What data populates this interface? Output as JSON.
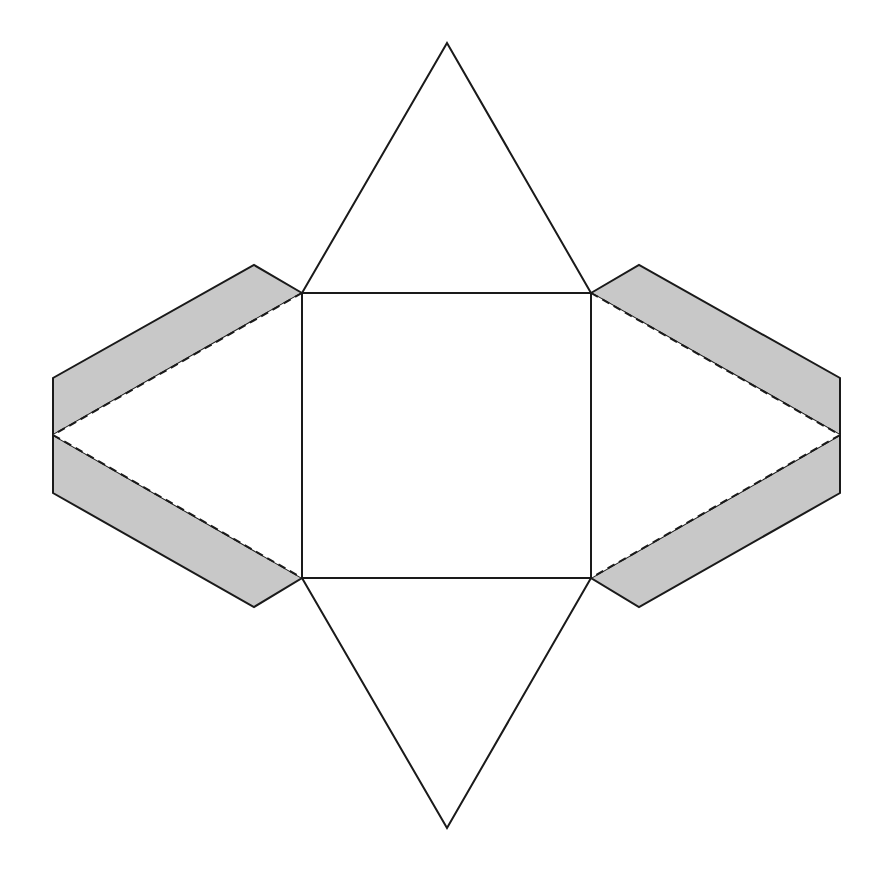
{
  "diagram": {
    "type": "net",
    "colors": {
      "background": "#ffffff",
      "stroke": "#1a1a1a",
      "tab_fill": "#c8c8c8"
    },
    "base_square": {
      "points": [
        [
          302,
          293
        ],
        [
          591,
          293
        ],
        [
          591,
          578
        ],
        [
          302,
          578
        ]
      ]
    },
    "triangles": [
      {
        "name": "top",
        "points": [
          [
            302,
            293
          ],
          [
            447,
            43
          ],
          [
            591,
            293
          ]
        ]
      },
      {
        "name": "bottom",
        "points": [
          [
            302,
            578
          ],
          [
            447,
            828
          ],
          [
            591,
            578
          ]
        ]
      },
      {
        "name": "left",
        "points": [
          [
            302,
            293
          ],
          [
            53,
            435
          ],
          [
            302,
            578
          ]
        ]
      },
      {
        "name": "right",
        "points": [
          [
            591,
            293
          ],
          [
            840,
            435
          ],
          [
            591,
            578
          ]
        ]
      }
    ],
    "tabs": [
      {
        "name": "left-upper",
        "points": [
          [
            302,
            293
          ],
          [
            254,
            265
          ],
          [
            53,
            378
          ],
          [
            53,
            435
          ]
        ]
      },
      {
        "name": "left-lower",
        "points": [
          [
            53,
            435
          ],
          [
            53,
            493
          ],
          [
            254,
            607
          ],
          [
            302,
            578
          ]
        ]
      },
      {
        "name": "right-upper",
        "points": [
          [
            591,
            293
          ],
          [
            639,
            265
          ],
          [
            840,
            378
          ],
          [
            840,
            435
          ]
        ]
      },
      {
        "name": "right-lower",
        "points": [
          [
            840,
            435
          ],
          [
            840,
            493
          ],
          [
            639,
            607
          ],
          [
            591,
            578
          ]
        ]
      }
    ],
    "fold_lines": [
      {
        "name": "left-upper-fold",
        "from": [
          302,
          293
        ],
        "to": [
          53,
          435
        ]
      },
      {
        "name": "left-lower-fold",
        "from": [
          53,
          435
        ],
        "to": [
          302,
          578
        ]
      },
      {
        "name": "right-upper-fold",
        "from": [
          591,
          293
        ],
        "to": [
          840,
          435
        ]
      },
      {
        "name": "right-lower-fold",
        "from": [
          840,
          435
        ],
        "to": [
          591,
          578
        ]
      }
    ]
  }
}
